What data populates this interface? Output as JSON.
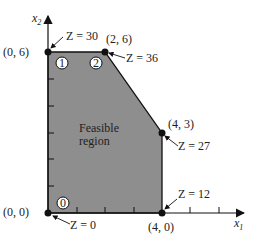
{
  "axes": {
    "x_label": "x",
    "x_sub": "1",
    "y_label": "x",
    "y_sub": "2"
  },
  "region": {
    "label_line1": "Feasible",
    "label_line2": "region",
    "fill": "#8e8e8e",
    "vertices": [
      [
        0,
        0
      ],
      [
        0,
        6
      ],
      [
        2,
        6
      ],
      [
        4,
        3
      ],
      [
        4,
        0
      ]
    ]
  },
  "points": [
    {
      "coord": "(0, 0)",
      "z": "Z = 0"
    },
    {
      "coord": "(0, 6)",
      "z": "Z = 30"
    },
    {
      "coord": "(2, 6)",
      "z": "Z = 36"
    },
    {
      "coord": "(4, 3)",
      "z": "Z = 27"
    },
    {
      "coord": "(4, 0)",
      "z": "Z = 12"
    }
  ],
  "markers": [
    "0",
    "1",
    "2"
  ]
}
